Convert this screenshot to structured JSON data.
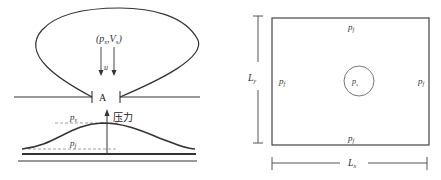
{
  "left_diagram": {
    "source_label": "(p",
    "source_sub_s": "s",
    "source_sep": ",V",
    "source_sub_v": "s",
    "source_close": ")",
    "flow_label": "u",
    "orifice_label": "A",
    "axis_label": "压力",
    "peak_pressure": {
      "base": "p",
      "sub": "s"
    },
    "ambient_pressure": {
      "base": "p",
      "sub": "f"
    }
  },
  "right_diagram": {
    "boundary_top": {
      "base": "p",
      "sub": "f"
    },
    "boundary_bottom": {
      "base": "p",
      "sub": "f"
    },
    "boundary_left": {
      "base": "p",
      "sub": "f"
    },
    "boundary_right": {
      "base": "p",
      "sub": "f"
    },
    "center": {
      "base": "p",
      "sub": "s"
    },
    "height_dim": {
      "base": "L",
      "sub": "y"
    },
    "width_dim": {
      "base": "L",
      "sub": "x"
    }
  },
  "colors": {
    "line": "#333333",
    "dash": "#888888",
    "circle": "#777777"
  }
}
